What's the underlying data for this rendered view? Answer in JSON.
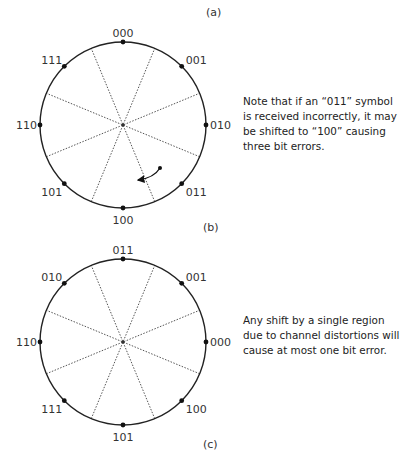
{
  "diagrams": [
    {
      "panel_label_top": "(a)",
      "panel_label_bottom": "(b)",
      "center": [
        123,
        125
      ],
      "radius": 83,
      "points": [
        {
          "label": "000",
          "angle_deg": 90
        },
        {
          "label": "001",
          "angle_deg": 45
        },
        {
          "label": "010",
          "angle_deg": 0
        },
        {
          "label": "011",
          "angle_deg": -45
        },
        {
          "label": "100",
          "angle_deg": -90
        },
        {
          "label": "101",
          "angle_deg": -135
        },
        {
          "label": "110",
          "angle_deg": 180
        },
        {
          "label": "111",
          "angle_deg": 135
        }
      ],
      "note": "Note that if an “011” symbol is received incorrectly, it may be shifted to “100” causing three bit errors.",
      "arrow": {
        "from": [
          160,
          168
        ],
        "to": [
          138,
          180
        ]
      }
    },
    {
      "panel_label_bottom": "(c)",
      "center": [
        123,
        342
      ],
      "radius": 83,
      "points": [
        {
          "label": "011",
          "angle_deg": 90
        },
        {
          "label": "001",
          "angle_deg": 45
        },
        {
          "label": "000",
          "angle_deg": 0
        },
        {
          "label": "100",
          "angle_deg": -45
        },
        {
          "label": "101",
          "angle_deg": -90
        },
        {
          "label": "111",
          "angle_deg": -135
        },
        {
          "label": "110",
          "angle_deg": 180
        },
        {
          "label": "010",
          "angle_deg": 135
        }
      ],
      "note": "Any shift by a single region due to channel distortions will cause at most one bit error."
    }
  ]
}
